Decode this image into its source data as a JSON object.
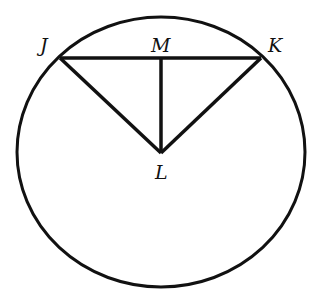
{
  "diagram": {
    "type": "circle-geometry",
    "circle": {
      "cx": 161,
      "cy": 152,
      "rx": 144,
      "ry": 135,
      "stroke": "#111111"
    },
    "points": {
      "J": {
        "label": "J",
        "x": 60,
        "y": 58
      },
      "K": {
        "label": "K",
        "x": 261,
        "y": 58
      },
      "M": {
        "label": "M",
        "x": 161,
        "y": 58
      },
      "L": {
        "label": "L",
        "x": 161,
        "y": 153
      }
    },
    "segments": [
      "JK",
      "JL",
      "KL",
      "ML"
    ],
    "labels": {
      "J": "J",
      "K": "K",
      "M": "M",
      "L": "L"
    }
  }
}
